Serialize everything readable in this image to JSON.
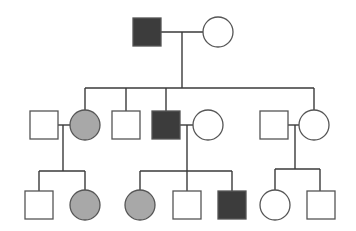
{
  "colors": {
    "line": "#3a3a3a",
    "affected": "#3c3c3c",
    "carrier": "#a8a8a8",
    "unaffected": "#ffffff"
  },
  "generations": [
    {
      "label": "I",
      "individuals": [
        {
          "id": "I-1",
          "sex": "male",
          "status": "affected"
        },
        {
          "id": "I-2",
          "sex": "female",
          "status": "unaffected"
        }
      ]
    },
    {
      "label": "II",
      "individuals": [
        {
          "id": "II-1",
          "sex": "male",
          "status": "unaffected",
          "note": "spouse"
        },
        {
          "id": "II-2",
          "sex": "female",
          "status": "carrier"
        },
        {
          "id": "II-3",
          "sex": "male",
          "status": "unaffected"
        },
        {
          "id": "II-4",
          "sex": "male",
          "status": "affected"
        },
        {
          "id": "II-5",
          "sex": "female",
          "status": "unaffected",
          "note": "spouse"
        },
        {
          "id": "II-6",
          "sex": "male",
          "status": "unaffected",
          "note": "spouse"
        },
        {
          "id": "II-7",
          "sex": "female",
          "status": "unaffected"
        }
      ]
    },
    {
      "label": "III",
      "individuals": [
        {
          "id": "III-1",
          "sex": "male",
          "status": "unaffected"
        },
        {
          "id": "III-2",
          "sex": "female",
          "status": "carrier"
        },
        {
          "id": "III-3",
          "sex": "female",
          "status": "carrier"
        },
        {
          "id": "III-4",
          "sex": "male",
          "status": "unaffected"
        },
        {
          "id": "III-5",
          "sex": "male",
          "status": "affected"
        },
        {
          "id": "III-6",
          "sex": "female",
          "status": "unaffected"
        },
        {
          "id": "III-7",
          "sex": "male",
          "status": "unaffected"
        }
      ]
    }
  ]
}
